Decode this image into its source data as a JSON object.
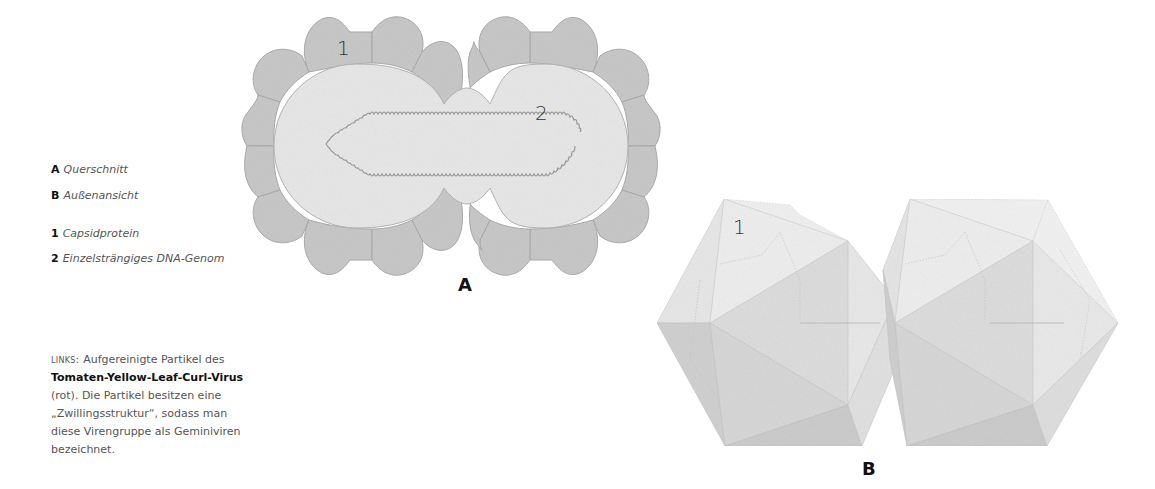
{
  "legend": {
    "items": [
      {
        "key": "A",
        "label": "Querschnitt"
      },
      {
        "key": "B",
        "label": "Außenansicht"
      },
      {
        "key": "1",
        "label": "Capsidprotein"
      },
      {
        "key": "2",
        "label": "Einzelsträngiges DNA-Genom"
      }
    ]
  },
  "caption": {
    "lead": "LINKS:",
    "line1_rest": " Aufgereinigte Partikel des",
    "virus_name": "Tomaten-Yellow-Leaf-Curl-Virus",
    "line3": "(rot). Die Partikel besitzen eine",
    "line4": "„Zwillingsstruktur“, sodass man",
    "line5": "diese Virengruppe als Geminiviren",
    "line6": "bezeichnet."
  },
  "figure_a": {
    "panel_label": "A",
    "capsid_label": "1",
    "genome_label": "2"
  },
  "figure_b": {
    "panel_label": "B",
    "capsid_label": "1"
  },
  "colors": {
    "capsid_fill": "#c9c9c9",
    "capsid_stroke": "#a8a8a8",
    "interior_fill": "#e6e6e6",
    "dna_stroke": "#9a9a9a",
    "ico_light": "#ececec",
    "ico_mid": "#dcdcdc",
    "ico_dark": "#cbcbcb"
  }
}
